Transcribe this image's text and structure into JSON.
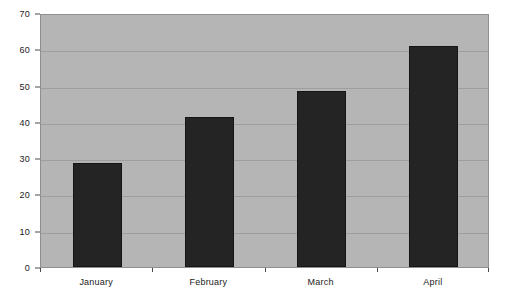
{
  "chart_data": {
    "type": "bar",
    "title": "",
    "subtitle": "",
    "xlabel": "",
    "ylabel": "",
    "categories": [
      "January",
      "February",
      "March",
      "April"
    ],
    "values": [
      28.6,
      41.3,
      48.5,
      61.0
    ],
    "series": [
      {
        "name": "",
        "values": [
          28.6,
          41.3,
          48.5,
          61.0
        ]
      }
    ],
    "ylim": [
      0,
      70
    ],
    "yticks": [
      0,
      10,
      20,
      30,
      40,
      50,
      60,
      70
    ],
    "ytick_labels": [
      "0",
      "10",
      "20",
      "30",
      "40",
      "50",
      "60",
      "70"
    ],
    "grid": true,
    "legend": false,
    "legend_position": "none",
    "annotations": []
  },
  "style": {
    "plot_background": "#b5b5b5",
    "bar_color": "#242424",
    "gridline_color": "#9e9e9e",
    "axis_color": "#4a4a4a",
    "text_color": "#1a1a1a",
    "canvas_background": "#ffffff"
  }
}
